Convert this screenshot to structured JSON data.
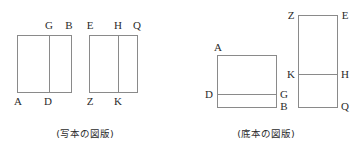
{
  "figure": {
    "type": "geometric-diagram",
    "stroke_color": "#8a8a8a",
    "text_color": "#2b2b2b",
    "background_color": "#ffffff",
    "panels": [
      {
        "id": "manuscript-panel",
        "caption": "(写本の図版)",
        "caption_x": 85,
        "caption_y": 128,
        "shapes": [
          {
            "name": "rect-ADGB",
            "kind": "rect",
            "x": 17,
            "y": 35,
            "width": 54,
            "height": 57,
            "dividers": [
              {
                "orientation": "vertical",
                "pos": 49
              }
            ]
          },
          {
            "name": "rect-ZKHE-Q",
            "kind": "rect",
            "x": 89,
            "y": 35,
            "width": 48,
            "height": 57,
            "dividers": [
              {
                "orientation": "vertical",
                "pos": 118
              }
            ]
          }
        ],
        "labels": [
          {
            "text": "G",
            "x": 49,
            "y": 20,
            "align": "center"
          },
          {
            "text": "B",
            "x": 69,
            "y": 20,
            "align": "center"
          },
          {
            "text": "E",
            "x": 90,
            "y": 20,
            "align": "center"
          },
          {
            "text": "H",
            "x": 118,
            "y": 20,
            "align": "center"
          },
          {
            "text": "Q",
            "x": 137,
            "y": 20,
            "align": "center"
          },
          {
            "text": "A",
            "x": 18,
            "y": 96,
            "align": "center"
          },
          {
            "text": "D",
            "x": 48,
            "y": 96,
            "align": "center"
          },
          {
            "text": "Z",
            "x": 90,
            "y": 96,
            "align": "center"
          },
          {
            "text": "K",
            "x": 118,
            "y": 96,
            "align": "center"
          }
        ]
      },
      {
        "id": "base-text-panel",
        "caption": "(底本の図版)",
        "caption_x": 266,
        "caption_y": 128,
        "shapes": [
          {
            "name": "rect-ADGB-base",
            "kind": "rect",
            "x": 217,
            "y": 55,
            "width": 59,
            "height": 52,
            "dividers": [
              {
                "orientation": "horizontal",
                "pos": 94
              }
            ]
          },
          {
            "name": "rect-ZEKHQ-base",
            "kind": "rect",
            "x": 298,
            "y": 15,
            "width": 39,
            "height": 92,
            "dividers": [
              {
                "orientation": "horizontal",
                "pos": 74
              }
            ]
          }
        ],
        "labels": [
          {
            "text": "A",
            "x": 218,
            "y": 42,
            "align": "center"
          },
          {
            "text": "D",
            "x": 209,
            "y": 89,
            "align": "center"
          },
          {
            "text": "G",
            "x": 284,
            "y": 89,
            "align": "center"
          },
          {
            "text": "B",
            "x": 284,
            "y": 101,
            "align": "center"
          },
          {
            "text": "Z",
            "x": 291,
            "y": 10,
            "align": "center"
          },
          {
            "text": "E",
            "x": 345,
            "y": 10,
            "align": "center"
          },
          {
            "text": "K",
            "x": 291,
            "y": 69,
            "align": "center"
          },
          {
            "text": "H",
            "x": 345,
            "y": 69,
            "align": "center"
          },
          {
            "text": "Q",
            "x": 345,
            "y": 101,
            "align": "center"
          }
        ]
      }
    ]
  }
}
